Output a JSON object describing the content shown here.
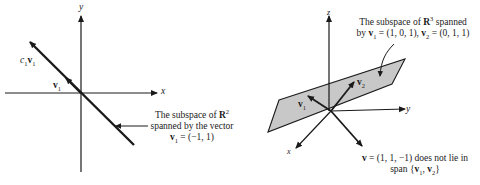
{
  "left_diagram": {
    "axis_x_label": "x",
    "axis_y_label": "y",
    "line_label": {
      "c": "c",
      "c_sub": "1",
      "v": "v",
      "v_sub": "1"
    },
    "vector_label": {
      "v": "v",
      "sub": "1"
    },
    "caption": {
      "line1_prefix": "The subspace of ",
      "line1_bold": "R",
      "line1_sup": "2",
      "line2": "spanned by the vector",
      "line3_v": "v",
      "line3_sub": "1",
      "line3_rest": " = (−1, 1)"
    }
  },
  "right_diagram": {
    "axis_x_label": "x",
    "axis_y_label": "y",
    "axis_z_label": "z",
    "v1_label": {
      "v": "v",
      "sub": "1"
    },
    "v2_label": {
      "v": "v",
      "sub": "2"
    },
    "plane_caption": {
      "line1_prefix": "The subspace of ",
      "line1_bold": "R",
      "line1_sup": "3",
      "line1_suffix": " spanned",
      "line2_a": "by ",
      "line2_v1": "v",
      "line2_v1_sub": "1",
      "line2_mid": " = (1, 0, 1), ",
      "line2_v2": "v",
      "line2_v2_sub": "2",
      "line2_end": " = (0, 1, 1)"
    },
    "v_caption": {
      "line1_v": "v",
      "line1_rest": " = (1, 1, −1) does not lie in",
      "line2_a": "span {",
      "line2_v1": "v",
      "line2_v1_sub": "1",
      "line2_comma": ", ",
      "line2_v2": "v",
      "line2_v2_sub": "2",
      "line2_end": "}"
    },
    "plane_color": "#c8c8c8"
  }
}
